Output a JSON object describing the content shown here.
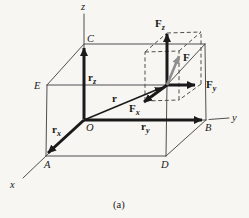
{
  "figure": {
    "caption": "(a)",
    "axes": {
      "x": "x",
      "y": "y",
      "z": "z"
    },
    "points": {
      "O": "O",
      "A": "A",
      "B": "B",
      "C": "C",
      "D": "D",
      "E": "E"
    },
    "vectors": {
      "F": {
        "base": "F"
      },
      "Fx": {
        "base": "F",
        "sub": "x"
      },
      "Fy": {
        "base": "F",
        "sub": "y"
      },
      "Fz": {
        "base": "F",
        "sub": "z"
      },
      "r": {
        "base": "r"
      },
      "rx": {
        "base": "r",
        "sub": "x"
      },
      "ry": {
        "base": "r",
        "sub": "y"
      },
      "rz": {
        "base": "r",
        "sub": "z"
      }
    },
    "colors": {
      "ink": "#1a1a1a",
      "box_line": "#4f4f4f",
      "force": "#8f8f8f",
      "paper": "#f7f6f2"
    }
  }
}
